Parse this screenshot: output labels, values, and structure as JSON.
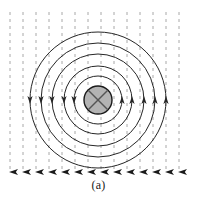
{
  "figure": {
    "caption": "(a)",
    "type": "physics-field-diagram",
    "colors": {
      "circle_stroke": "#262626",
      "uniform_field_line": "#a8a8a8",
      "uniform_field_arrow": "#1a1a1a",
      "wire_disk_fill": "#b3b3b3",
      "wire_disk_stroke": "#1a1a1a",
      "cross_stroke": "#555555",
      "background": "#ffffff",
      "caption_color": "#1a1a1a"
    },
    "center": {
      "x": 98,
      "y": 100
    },
    "wire_symbol": {
      "name": "current-into-page",
      "glyph": "cross",
      "radius": 14
    },
    "field_circles": {
      "count": 5,
      "radii": [
        24,
        34,
        46,
        57,
        68
      ],
      "arrow_side_left": "up",
      "arrow_side_right": "down",
      "sense": "counterclockwise"
    },
    "uniform_field": {
      "direction": "down",
      "line_count": 14,
      "x_positions": [
        10,
        23,
        36,
        49,
        62,
        75,
        88,
        101,
        114,
        127,
        140,
        153,
        166,
        179
      ],
      "y_top": 12,
      "y_bottom": 172,
      "dash": "3 4"
    }
  }
}
